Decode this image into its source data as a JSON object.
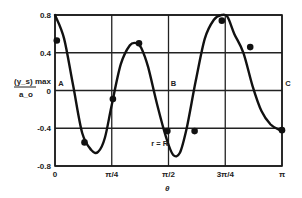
{
  "chart_data": {
    "type": "line",
    "title": "",
    "xlabel": "θ",
    "ylabel_num": "(y_s) max",
    "ylabel_den": "a_o",
    "xlim": [
      0,
      3.14159
    ],
    "ylim": [
      -0.8,
      0.8
    ],
    "grid": true,
    "x_ticks": [
      {
        "value": 0,
        "label": "0"
      },
      {
        "value": 0.25,
        "label": "π/4"
      },
      {
        "value": 0.5,
        "label": "π/2"
      },
      {
        "value": 0.75,
        "label": "3π/4"
      },
      {
        "value": 1.0,
        "label": "π"
      }
    ],
    "y_ticks": [
      {
        "value": 0.8,
        "label": "0.8"
      },
      {
        "value": 0.4,
        "label": "0.4"
      },
      {
        "value": 0.0,
        "label": "0"
      },
      {
        "value": -0.4,
        "label": "-0.4"
      },
      {
        "value": -0.8,
        "label": "-0.8"
      }
    ],
    "annotations": [
      {
        "text": "A",
        "x_frac_pi": 0.01,
        "y": 0.04
      },
      {
        "text": "B",
        "x_frac_pi": 0.505,
        "y": 0.04
      },
      {
        "text": "C",
        "x_frac_pi": 1.01,
        "y": 0.04
      },
      {
        "text": "r = R",
        "x_frac_pi": 0.42,
        "y": -0.6
      }
    ],
    "series": [
      {
        "name": "computed curve",
        "style": "line",
        "x_frac_pi": [
          0.0,
          0.04,
          0.08,
          0.12,
          0.16,
          0.19,
          0.22,
          0.25,
          0.29,
          0.33,
          0.36,
          0.38,
          0.41,
          0.45,
          0.49,
          0.52,
          0.55,
          0.58,
          0.62,
          0.66,
          0.7,
          0.735,
          0.76,
          0.79,
          0.83,
          0.87,
          0.91,
          0.95,
          0.99
        ],
        "values": [
          0.8,
          0.55,
          0.05,
          -0.45,
          -0.63,
          -0.65,
          -0.5,
          -0.15,
          0.28,
          0.48,
          0.5,
          0.45,
          0.25,
          -0.15,
          -0.5,
          -0.68,
          -0.66,
          -0.4,
          0.1,
          0.55,
          0.75,
          0.8,
          0.78,
          0.6,
          0.4,
          0.05,
          -0.22,
          -0.36,
          -0.42
        ]
      },
      {
        "name": "measured points",
        "style": "markers",
        "x_frac_pi": [
          0.008,
          0.13,
          0.255,
          0.37,
          0.495,
          0.615,
          0.735,
          0.86,
          1.0
        ],
        "values": [
          0.53,
          -0.55,
          -0.09,
          0.5,
          -0.43,
          -0.43,
          0.74,
          0.46,
          -0.42
        ]
      }
    ]
  }
}
